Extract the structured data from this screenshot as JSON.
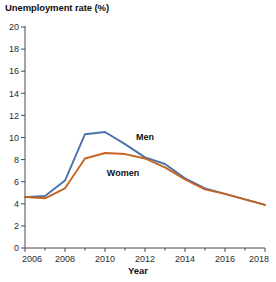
{
  "chart_data": {
    "type": "line",
    "title": "Unemployment rate (%)",
    "xlabel": "Year",
    "ylabel": "",
    "xlim": [
      2006,
      2018
    ],
    "ylim": [
      0,
      20
    ],
    "grid": false,
    "legend_position": "inline-annotation",
    "x": [
      2006,
      2007,
      2008,
      2009,
      2010,
      2011,
      2012,
      2013,
      2014,
      2015,
      2016,
      2017,
      2018
    ],
    "xticks": [
      2006,
      2008,
      2010,
      2012,
      2014,
      2016,
      2018
    ],
    "xtick_labels": [
      "2006",
      "2008",
      "2010",
      "2012",
      "2014",
      "2016",
      "2018"
    ],
    "xminor_ticks": [
      2007,
      2009,
      2011,
      2013,
      2015,
      2017
    ],
    "yticks": [
      0,
      2,
      4,
      6,
      8,
      10,
      12,
      14,
      16,
      18,
      20
    ],
    "ytick_labels": [
      "0",
      "2",
      "4",
      "6",
      "8",
      "10",
      "12",
      "14",
      "16",
      "18",
      "20"
    ],
    "series": [
      {
        "name": "Men",
        "color": "#4a72a8",
        "label_text": "Men",
        "label_x": 2012.0,
        "label_y": 9.8,
        "values": [
          4.6,
          4.7,
          6.1,
          10.3,
          10.5,
          9.4,
          8.2,
          7.6,
          6.3,
          5.4,
          4.9,
          4.4,
          3.9
        ]
      },
      {
        "name": "Women",
        "color": "#c5641e",
        "label_text": "Women",
        "label_x": 2010.9,
        "label_y": 6.5,
        "values": [
          4.6,
          4.5,
          5.4,
          8.1,
          8.6,
          8.5,
          8.1,
          7.3,
          6.2,
          5.3,
          4.9,
          4.4,
          3.9
        ]
      }
    ]
  },
  "axis": {
    "x_title": "Year",
    "y_title": "Unemployment rate (%)"
  }
}
